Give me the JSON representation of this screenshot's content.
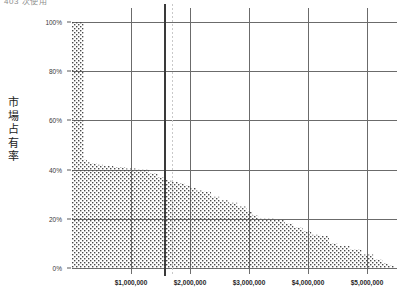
{
  "chart_title": "403 次使用",
  "y_axis_title_chars": [
    "市",
    "場",
    "占",
    "有",
    "率"
  ],
  "colors": {
    "grid": "#6b6b6b",
    "fill_dots": "#4a4a4a",
    "reference_solid": "#3a3a3a",
    "reference_dashed": "#c9c9c9",
    "text": "#1f1f1f"
  },
  "chart_data": {
    "type": "area",
    "title": "403 次使用",
    "xlabel": "",
    "ylabel": "市場占有率",
    "xlim": [
      0,
      5500000
    ],
    "ylim": [
      0,
      100
    ],
    "grid": true,
    "legend": false,
    "y_ticks": [
      {
        "value": 100,
        "label": "100%"
      },
      {
        "value": 80,
        "label": "80%"
      },
      {
        "value": 60,
        "label": "60%"
      },
      {
        "value": 40,
        "label": "40%"
      },
      {
        "value": 20,
        "label": "20%"
      },
      {
        "value": 0,
        "label": "0%"
      }
    ],
    "x_ticks": [
      {
        "value": 1000000,
        "label": "$1,000,000"
      },
      {
        "value": 2000000,
        "label": "$2,000,000"
      },
      {
        "value": 3000000,
        "label": "$3,000,000"
      },
      {
        "value": 4000000,
        "label": "$4,000,000"
      },
      {
        "value": 5000000,
        "label": "$5,000,000"
      }
    ],
    "reference_lines": [
      {
        "name": "threshold-solid",
        "x": 1560000,
        "style": "solid",
        "color": "#3a3a3a",
        "width": 2
      },
      {
        "name": "threshold-dashed",
        "x": 1700000,
        "style": "dashed",
        "color": "#c9c9c9",
        "width": 1
      }
    ],
    "x": [
      0,
      100000,
      150000,
      200000,
      250000,
      320000,
      420000,
      520000,
      700000,
      900000,
      1100000,
      1300000,
      1450000,
      1560000,
      1620000,
      1700000,
      1800000,
      1900000,
      2000000,
      2100000,
      2200000,
      2350000,
      2500000,
      2650000,
      2800000,
      2950000,
      3050000,
      3150000,
      3300000,
      3450000,
      3600000,
      3750000,
      3900000,
      4050000,
      4200000,
      4350000,
      4500000,
      4700000,
      4900000,
      5100000,
      5250000,
      5350000,
      5450000
    ],
    "y": [
      100,
      100,
      100,
      44,
      43,
      42.5,
      42,
      41.5,
      41,
      40.5,
      40,
      38.5,
      37,
      36,
      35.5,
      35,
      34.5,
      33.5,
      32.5,
      31.5,
      31,
      29,
      27.5,
      26.5,
      25,
      23,
      21.5,
      20,
      20,
      19.5,
      18,
      16.5,
      15,
      13.5,
      13,
      10,
      9,
      7.5,
      5.5,
      3.5,
      2,
      1,
      0
    ],
    "series_name": "市場占有率"
  }
}
